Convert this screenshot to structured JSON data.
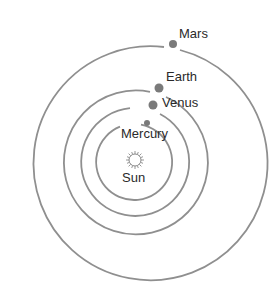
{
  "diagram": {
    "type": "solar-system-orbits",
    "center": {
      "x": 134,
      "y": 162
    },
    "sun": {
      "label": "Sun",
      "x": 135,
      "y": 160,
      "radius": 6
    },
    "colors": {
      "orbit": "#8f8f8f",
      "planet": "#7a7a7a",
      "text": "#2a2a2a",
      "background": "#ffffff"
    },
    "planets": [
      {
        "name": "Mercury",
        "label": "Mercury",
        "orbit_radius": 38,
        "dot": {
          "x": 147,
          "y": 123,
          "r": 3
        }
      },
      {
        "name": "Venus",
        "label": "Venus",
        "orbit_radius": 54,
        "dot": {
          "x": 153,
          "y": 105,
          "r": 4.5
        }
      },
      {
        "name": "Earth",
        "label": "Earth",
        "orbit_radius": 72,
        "dot": {
          "x": 159,
          "y": 88,
          "r": 4.5
        }
      },
      {
        "name": "Mars",
        "label": "Mars",
        "orbit_radius": 117,
        "dot": {
          "x": 173,
          "y": 44,
          "r": 4
        }
      }
    ]
  }
}
